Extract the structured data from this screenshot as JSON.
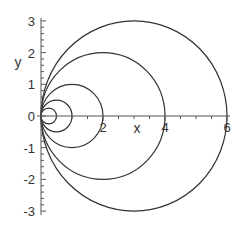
{
  "chart_data": {
    "type": "line",
    "title": "",
    "xlabel": "x",
    "ylabel": "y",
    "xlim": [
      0,
      6
    ],
    "ylim": [
      -3,
      3
    ],
    "grid": false,
    "legend": null,
    "x_ticks": [
      {
        "value": 0,
        "label": "0"
      },
      {
        "value": 2,
        "label": "2"
      },
      {
        "value": 4,
        "label": "4"
      },
      {
        "value": 6,
        "label": "6"
      }
    ],
    "y_ticks": [
      {
        "value": -3,
        "label": "-3"
      },
      {
        "value": -2,
        "label": "-2"
      },
      {
        "value": -1,
        "label": "-1"
      },
      {
        "value": 0,
        "label": "0"
      },
      {
        "value": 1,
        "label": "1"
      },
      {
        "value": 2,
        "label": "2"
      },
      {
        "value": 3,
        "label": "3"
      }
    ],
    "series": [
      {
        "name": "circle r=0.25",
        "shape": "circle",
        "center": [
          0.25,
          0
        ],
        "radius": 0.25
      },
      {
        "name": "circle r=0.5",
        "shape": "circle",
        "center": [
          0.5,
          0
        ],
        "radius": 0.5
      },
      {
        "name": "circle r=1",
        "shape": "circle",
        "center": [
          1,
          0
        ],
        "radius": 1
      },
      {
        "name": "circle r=2",
        "shape": "circle",
        "center": [
          2,
          0
        ],
        "radius": 2
      },
      {
        "name": "circle r=3",
        "shape": "circle",
        "center": [
          3,
          0
        ],
        "radius": 3
      }
    ],
    "line_color": "#333333",
    "axis_color": "#555555"
  },
  "layout": {
    "origin_px": [
      41,
      116
    ],
    "x_scale": 31,
    "y_scale": 31.7
  }
}
